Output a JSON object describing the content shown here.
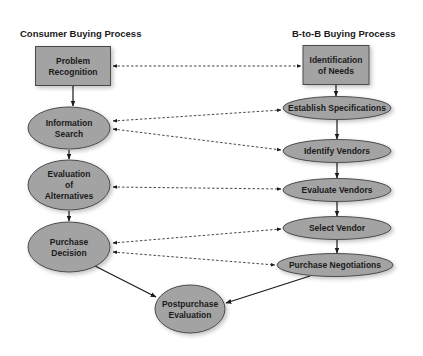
{
  "headers": {
    "consumer": "Consumer Buying Process",
    "b2b": "B-to-B Buying Process"
  },
  "consumer_steps": [
    {
      "id": "problem-recognition",
      "shape": "rectangle",
      "lines": [
        "Problem",
        "Recognition"
      ]
    },
    {
      "id": "information-search",
      "shape": "ellipse",
      "lines": [
        "Information",
        "Search"
      ]
    },
    {
      "id": "evaluation-of-alternatives",
      "shape": "ellipse",
      "lines": [
        "Evaluation",
        "of",
        "Alternatives"
      ]
    },
    {
      "id": "purchase-decision",
      "shape": "ellipse",
      "lines": [
        "Purchase",
        "Decision"
      ]
    },
    {
      "id": "postpurchase-evaluation",
      "shape": "ellipse",
      "lines": [
        "Postpurchase",
        "Evaluation"
      ]
    }
  ],
  "b2b_steps": [
    {
      "id": "identification-of-needs",
      "shape": "rectangle",
      "lines": [
        "Identification",
        "of Needs"
      ]
    },
    {
      "id": "establish-specifications",
      "shape": "ellipse",
      "lines": [
        "Establish Specifications"
      ]
    },
    {
      "id": "identify-vendors",
      "shape": "ellipse",
      "lines": [
        "Identify Vendors"
      ]
    },
    {
      "id": "evaluate-vendors",
      "shape": "ellipse",
      "lines": [
        "Evaluate Vendors"
      ]
    },
    {
      "id": "select-vendor",
      "shape": "ellipse",
      "lines": [
        "Select Vendor"
      ]
    },
    {
      "id": "purchase-negotiations",
      "shape": "ellipse",
      "lines": [
        "Purchase Negotiations"
      ]
    }
  ],
  "flows": [
    {
      "from": "problem-recognition",
      "to": "information-search",
      "style": "solid"
    },
    {
      "from": "information-search",
      "to": "evaluation-of-alternatives",
      "style": "solid"
    },
    {
      "from": "evaluation-of-alternatives",
      "to": "purchase-decision",
      "style": "solid"
    },
    {
      "from": "purchase-decision",
      "to": "postpurchase-evaluation",
      "style": "solid"
    },
    {
      "from": "identification-of-needs",
      "to": "establish-specifications",
      "style": "solid"
    },
    {
      "from": "establish-specifications",
      "to": "identify-vendors",
      "style": "solid"
    },
    {
      "from": "identify-vendors",
      "to": "evaluate-vendors",
      "style": "solid"
    },
    {
      "from": "evaluate-vendors",
      "to": "select-vendor",
      "style": "solid"
    },
    {
      "from": "select-vendor",
      "to": "purchase-negotiations",
      "style": "solid"
    },
    {
      "from": "purchase-negotiations",
      "to": "postpurchase-evaluation",
      "style": "solid"
    }
  ],
  "correspondences": [
    {
      "a": "problem-recognition",
      "b": "identification-of-needs",
      "style": "dashed-bidirectional"
    },
    {
      "a": "information-search",
      "b": "establish-specifications",
      "style": "dashed-bidirectional"
    },
    {
      "a": "information-search",
      "b": "identify-vendors",
      "style": "dashed-bidirectional"
    },
    {
      "a": "evaluation-of-alternatives",
      "b": "evaluate-vendors",
      "style": "dashed-bidirectional"
    },
    {
      "a": "purchase-decision",
      "b": "select-vendor",
      "style": "dashed-bidirectional"
    },
    {
      "a": "purchase-decision",
      "b": "purchase-negotiations",
      "style": "dashed-bidirectional"
    }
  ]
}
